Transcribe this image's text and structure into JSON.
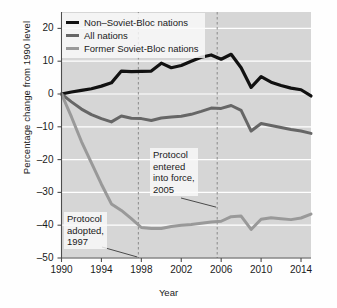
{
  "chart_data": {
    "type": "line",
    "title": "",
    "xlabel": "Year",
    "ylabel": "Percentage change from 1990 level",
    "xlim": [
      1990,
      2015
    ],
    "ylim": [
      -50,
      25
    ],
    "xticks": [
      1990,
      1994,
      1998,
      2002,
      2006,
      2010,
      2014
    ],
    "yticks": [
      20,
      10,
      0,
      -10,
      -20,
      -30,
      -40,
      -50
    ],
    "grid": "horizontal-white",
    "legend_position": "top-left",
    "x": [
      1990,
      1991,
      1992,
      1993,
      1994,
      1995,
      1996,
      1997,
      1998,
      1999,
      2000,
      2001,
      2002,
      2003,
      2004,
      2005,
      2006,
      2007,
      2008,
      2009,
      2010,
      2011,
      2012,
      2013,
      2014,
      2015
    ],
    "series": [
      {
        "name": "Non–Soviet-Bloc nations",
        "color": "#111111",
        "width": 3.2,
        "values": [
          0.0,
          0.6,
          1.1,
          1.6,
          2.4,
          3.4,
          7.0,
          6.8,
          6.9,
          7.0,
          9.4,
          8.0,
          8.7,
          10.0,
          11.2,
          11.9,
          10.6,
          12.1,
          8.0,
          2.0,
          5.3,
          3.6,
          2.6,
          1.8,
          1.3,
          -0.6
        ]
      },
      {
        "name": "All nations",
        "color": "#666666",
        "width": 3.0,
        "values": [
          0.0,
          -2.4,
          -4.6,
          -6.3,
          -7.5,
          -8.5,
          -6.7,
          -7.4,
          -7.5,
          -8.1,
          -7.3,
          -7.0,
          -6.8,
          -6.2,
          -5.3,
          -4.3,
          -4.4,
          -3.5,
          -5.0,
          -11.3,
          -9.0,
          -9.6,
          -10.2,
          -10.8,
          -11.3,
          -12.0
        ]
      },
      {
        "name": "Former Soviet-Bloc nations",
        "color": "#999999",
        "width": 3.0,
        "values": [
          0.0,
          -7.0,
          -14.5,
          -21.0,
          -27.5,
          -33.5,
          -35.5,
          -38.0,
          -40.7,
          -41.0,
          -41.0,
          -40.4,
          -40.0,
          -39.8,
          -39.4,
          -39.0,
          -38.8,
          -37.4,
          -37.2,
          -41.3,
          -38.2,
          -37.7,
          -38.0,
          -38.3,
          -37.8,
          -36.6
        ]
      }
    ],
    "vertical_markers": [
      {
        "label": "Protocol adopted, 1997",
        "year": 1997.7,
        "style": "dashed",
        "color": "#999999"
      },
      {
        "label": "Protocol entered into force, 2005",
        "year": 2005.6,
        "style": "dashed",
        "color": "#999999"
      }
    ],
    "annotations": [
      {
        "name": "protocol-adopted",
        "lines": [
          "Protocol",
          "adopted,",
          "1997"
        ],
        "leader_to_year": 1997.7,
        "leader_to_value": -49.5
      },
      {
        "name": "protocol-entered-into-force",
        "lines": [
          "Protocol",
          "entered",
          "into force,",
          "2005"
        ],
        "leader_to_year": 2005.6,
        "leader_to_value": -34.5
      }
    ]
  },
  "legend": {
    "items": [
      {
        "label": "Non–Soviet-Bloc nations",
        "color": "#111111"
      },
      {
        "label": "All nations",
        "color": "#666666"
      },
      {
        "label": "Former Soviet-Bloc nations",
        "color": "#999999"
      }
    ]
  },
  "axes": {
    "x_title": "Year",
    "y_title": "Percentage change from 1990 level",
    "x_tick_labels": [
      "1990",
      "1994",
      "1998",
      "2002",
      "2006",
      "2010",
      "2014"
    ],
    "y_tick_labels": [
      "20",
      "10",
      "0",
      "–10",
      "–20",
      "–30",
      "–40",
      "–50"
    ]
  },
  "annotations": {
    "adopted": {
      "line1": "Protocol",
      "line2": "adopted,",
      "line3": "1997"
    },
    "force": {
      "line1": "Protocol",
      "line2": "entered",
      "line3": "into force,",
      "line4": "2005"
    }
  },
  "colors": {
    "plot_background": "#d6d6d6",
    "gridline": "#ffffff",
    "axis": "#4d4d4d",
    "series_black": "#111111",
    "series_darkgrey": "#666666",
    "series_lightgrey": "#999999"
  }
}
